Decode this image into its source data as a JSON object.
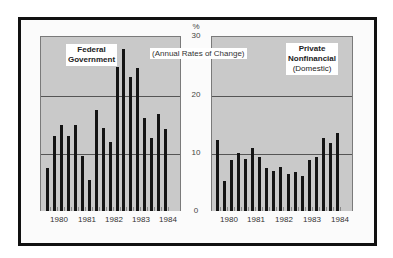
{
  "chart_data": [
    {
      "type": "bar",
      "title": "Federal Government",
      "subtitle": "(Annual Rates of Change)",
      "ylabel": "%",
      "ylim": [
        0,
        30
      ],
      "yticks": [
        0,
        10,
        20,
        30
      ],
      "xticks": [
        "1980",
        "1981",
        "1982",
        "1983",
        "1984"
      ],
      "grid": "horizontal at 10 and 20",
      "categories": [
        "1980 Q1",
        "1980 Q2",
        "1980 Q3",
        "1980 Q4",
        "1981 Q1",
        "1981 Q2",
        "1981 Q3",
        "1981 Q4",
        "1982 Q1",
        "1982 Q2",
        "1982 Q3",
        "1982 Q4",
        "1983 Q1",
        "1983 Q2",
        "1983 Q3",
        "1983 Q4",
        "1984 Q1",
        "1984 Q2"
      ],
      "values": [
        7.4,
        12.8,
        14.7,
        12.9,
        14.7,
        9.4,
        5.4,
        17.3,
        14.3,
        11.9,
        24.7,
        27.7,
        23.0,
        24.5,
        15.9,
        12.6,
        16.6,
        14.0
      ]
    },
    {
      "type": "bar",
      "title": "Private Nonfinancial",
      "subtitle": "(Domestic)",
      "ylabel": "%",
      "ylim": [
        0,
        30
      ],
      "yticks": [
        0,
        10,
        20,
        30
      ],
      "xticks": [
        "1980",
        "1981",
        "1982",
        "1983",
        "1984"
      ],
      "grid": "horizontal at 10 and 20",
      "categories": [
        "1980 Q1",
        "1980 Q2",
        "1980 Q3",
        "1980 Q4",
        "1981 Q1",
        "1981 Q2",
        "1981 Q3",
        "1981 Q4",
        "1982 Q1",
        "1982 Q2",
        "1982 Q3",
        "1982 Q4",
        "1983 Q1",
        "1983 Q2",
        "1983 Q3",
        "1983 Q4",
        "1984 Q1",
        "1984 Q2"
      ],
      "values": [
        12.1,
        5.2,
        8.7,
        10.0,
        9.0,
        10.8,
        9.3,
        7.3,
        6.8,
        7.5,
        6.3,
        6.7,
        6.0,
        8.7,
        9.3,
        12.6,
        11.6,
        13.4
      ]
    }
  ],
  "labels": {
    "left_title_line1": "Federal",
    "left_title_line2": "Government",
    "right_title_line1": "Private",
    "right_title_line2": "Nonfinancial",
    "right_title_line3": "(Domestic)",
    "subtitle": "(Annual Rates of Change)",
    "y_unit": "%",
    "y_ticks": [
      "30",
      "20",
      "10",
      "0"
    ],
    "years": [
      "1980",
      "1981",
      "1982",
      "1983",
      "1984"
    ]
  }
}
